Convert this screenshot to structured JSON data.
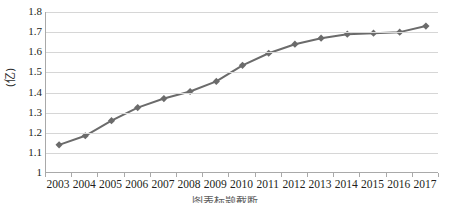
{
  "chart_data": {
    "type": "line",
    "title": "",
    "xlabel": "",
    "ylabel": "(亿)",
    "categories": [
      "2003",
      "2004",
      "2005",
      "2006",
      "2007",
      "2008",
      "2009",
      "2010",
      "2011",
      "2012",
      "2013",
      "2014",
      "2015",
      "2016",
      "2017"
    ],
    "values": [
      1.14,
      1.185,
      1.26,
      1.325,
      1.37,
      1.405,
      1.455,
      1.535,
      1.595,
      1.64,
      1.67,
      1.69,
      1.695,
      1.7,
      1.73
    ],
    "series": [
      {
        "name": "series-1",
        "values": [
          1.14,
          1.185,
          1.26,
          1.325,
          1.37,
          1.405,
          1.455,
          1.535,
          1.595,
          1.64,
          1.67,
          1.69,
          1.695,
          1.7,
          1.73
        ]
      }
    ],
    "ylim": [
      1.0,
      1.8
    ],
    "ytick_labels": [
      "1.8",
      "1.7",
      "1.6",
      "1.5",
      "1.4",
      "1.3",
      "1.2",
      "1.1",
      "1"
    ],
    "ytick_values": [
      1.8,
      1.7,
      1.6,
      1.5,
      1.4,
      1.3,
      1.2,
      1.1,
      1.0
    ],
    "grid": true,
    "grid_axis": "y",
    "legend": false,
    "legend_position": "none",
    "marker": "diamond",
    "line_color": "#6b6b6b",
    "marker_color": "#6b6b6b",
    "grid_color": "#d6d6d6",
    "axis_color": "#a9a9a9",
    "background_color": "#ffffff"
  },
  "caption": {
    "text": "图表标题截断"
  }
}
